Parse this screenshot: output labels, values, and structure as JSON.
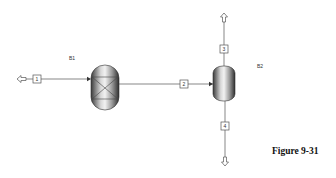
{
  "diagram": {
    "type": "process-flowsheet",
    "blocks": [
      {
        "id": "B1",
        "label": "B1",
        "kind": "packed-reactor-vessel"
      },
      {
        "id": "B2",
        "label": "B2",
        "kind": "flash-separator-vessel"
      }
    ],
    "streams": [
      {
        "id": "1",
        "label": "1",
        "from": "feed",
        "to": "B1"
      },
      {
        "id": "2",
        "label": "2",
        "from": "B1",
        "to": "B2"
      },
      {
        "id": "3",
        "label": "3",
        "from": "B2",
        "to": "product-top"
      },
      {
        "id": "4",
        "label": "4",
        "from": "B2",
        "to": "product-bottom"
      }
    ]
  },
  "caption": "Figure 9-31"
}
